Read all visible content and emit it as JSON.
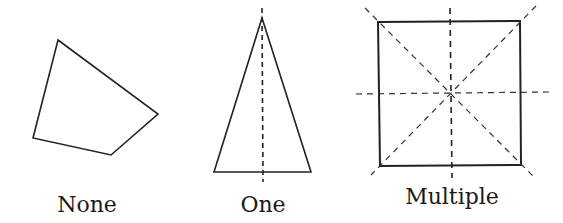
{
  "figure": {
    "stroke_color": "#222222",
    "shapes": [
      {
        "name": "quadrilateral",
        "label": "None",
        "symmetry_lines": 0,
        "points": "58,40 158,114 111,155 33,138",
        "axes": []
      },
      {
        "name": "isosceles-triangle",
        "label": "One",
        "symmetry_lines": 1,
        "points": "262,18 311,172 214,172",
        "axes": [
          {
            "x1": 262,
            "y1": 8,
            "x2": 263,
            "y2": 182
          }
        ]
      },
      {
        "name": "square",
        "label": "Multiple",
        "symmetry_lines": 4,
        "points": "378,22 520,21 521,165 380,166",
        "axes": [
          {
            "x1": 450,
            "y1": 8,
            "x2": 452,
            "y2": 178
          },
          {
            "x1": 356,
            "y1": 94,
            "x2": 549,
            "y2": 92
          },
          {
            "x1": 365,
            "y1": 8,
            "x2": 535,
            "y2": 178
          },
          {
            "x1": 536,
            "y1": 6,
            "x2": 371,
            "y2": 175
          }
        ]
      }
    ],
    "labels": [
      {
        "text": "None",
        "x": 87,
        "y": 212
      },
      {
        "text": "One",
        "x": 263,
        "y": 212
      },
      {
        "text": "Multiple",
        "x": 452,
        "y": 204
      }
    ]
  }
}
